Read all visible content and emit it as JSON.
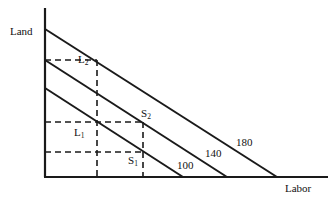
{
  "figure": {
    "type": "economics-isoquant-diagram",
    "width": 329,
    "height": 201,
    "background": "#ffffff",
    "line_color": "#1a1a1a",
    "axes": {
      "y_label": "Land",
      "x_label": "Labor",
      "origin": {
        "x": 45,
        "y": 177
      },
      "y_top": 8,
      "x_right": 328
    },
    "isoquants": [
      {
        "name": "100",
        "label": "100",
        "y_intercept": 88,
        "x_intercept": 183,
        "label_x": 177,
        "label_y": 160
      },
      {
        "name": "140",
        "label": "140",
        "y_intercept": 60,
        "x_intercept": 227,
        "label_x": 205,
        "label_y": 148
      },
      {
        "name": "180",
        "label": "180",
        "y_intercept": 29,
        "x_intercept": 277,
        "label_x": 236,
        "label_y": 137
      }
    ],
    "points": [
      {
        "name": "L1",
        "label": "L",
        "sub": "1",
        "x": 97,
        "y": 122,
        "label_x": 74,
        "label_y": 127
      },
      {
        "name": "L2",
        "label": "L",
        "sub": "2",
        "x": 97,
        "y": 60,
        "label_x": 78,
        "label_y": 54
      },
      {
        "name": "S1",
        "label": "S",
        "sub": "1",
        "x": 143,
        "y": 152,
        "label_x": 128,
        "label_y": 155
      },
      {
        "name": "S2",
        "label": "S",
        "sub": "2",
        "x": 143,
        "y": 122,
        "label_x": 141,
        "label_y": 108
      }
    ],
    "guide_lines": {
      "horizontal": [
        {
          "name": "guide-h-L2",
          "y": 60,
          "x_from": 45,
          "x_to": 97
        },
        {
          "name": "guide-h-L1",
          "y": 122,
          "x_from": 45,
          "x_to": 143
        },
        {
          "name": "guide-h-S1",
          "y": 152,
          "x_from": 45,
          "x_to": 143
        }
      ],
      "vertical": [
        {
          "name": "guide-v-L2",
          "x": 97,
          "y_from": 60,
          "y_to": 177
        },
        {
          "name": "guide-v-S",
          "x": 143,
          "y_from": 122,
          "y_to": 177
        }
      ]
    }
  }
}
